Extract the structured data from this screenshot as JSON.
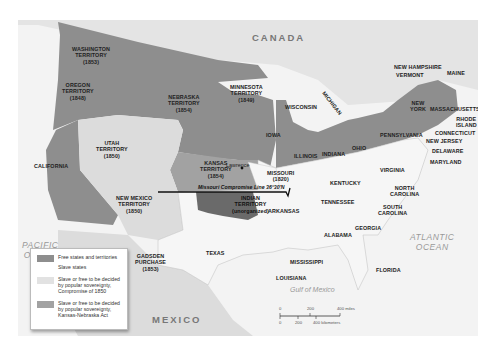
{
  "map": {
    "countries": {
      "canada": "CANADA",
      "mexico": "MEXICO"
    },
    "oceans": {
      "pacific": "PACIFIC\nOCEAN",
      "atlantic": "ATLANTIC\nOCEAN",
      "gulf": "Gulf of Mexico"
    },
    "territories": {
      "washington": "WASHINGTON\nTERRITORY\n(1853)",
      "oregon": "OREGON\nTERRITORY\n(1848)",
      "nebraska": "NEBRASKA\nTERRITORY\n(1854)",
      "minnesota": "MINNESOTA\nTERRITORY\n(1849)",
      "utah": "UTAH\nTERRITORY\n(1850)",
      "kansas": "KANSAS\nTERRITORY\n(1854)",
      "new_mexico": "NEW MEXICO\nTERRITORY\n(1850)",
      "indian": "INDIAN\nTERRITORY\n(unorganized)",
      "gadsden": "GADSDEN\nPURCHASE\n(1853)"
    },
    "states": {
      "california": "CALIFORNIA",
      "texas": "TEXAS",
      "missouri": "MISSOURI\n(1820)",
      "iowa": "IOWA",
      "wisconsin": "WISCONSIN",
      "michigan": "MICHIGAN",
      "illinois": "ILLINOIS",
      "indiana": "INDIANA",
      "ohio": "OHIO",
      "pennsylvania": "PENNSYLVANIA",
      "new_york": "NEW\nYORK",
      "new_hampshire": "NEW HAMPSHIRE",
      "vermont": "VERMONT",
      "maine": "MAINE",
      "massachusetts": "MASSACHUSETTS",
      "rhode_island": "RHODE\nISLAND",
      "connecticut": "CONNECTICUT",
      "new_jersey": "NEW JERSEY",
      "delaware": "DELAWARE",
      "maryland": "MARYLAND",
      "virginia": "VIRGINIA",
      "kentucky": "KENTUCKY",
      "tennessee": "TENNESSEE",
      "north_carolina": "NORTH\nCAROLINA",
      "south_carolina": "SOUTH\nCAROLINA",
      "georgia": "GEORGIA",
      "alabama": "ALABAMA",
      "mississippi": "MISSISSIPPI",
      "arkansas": "ARKANSAS",
      "louisiana": "LOUISIANA",
      "florida": "FLORIDA"
    },
    "towns": {
      "lawrence": "Lawrence"
    },
    "compromise_line": "Missouri Compromise Line 36°30'N"
  },
  "legend": {
    "items": [
      {
        "label": "Free states and territories",
        "color": "#8e8e8e"
      },
      {
        "label": "Slave states",
        "color": "#f2f2f2"
      },
      {
        "label": "Slave or free to be decided\nby popular sovereignty,\nCompromise of 1850",
        "color": "#dcdcdc"
      },
      {
        "label": "Slave or free to be decided\nby popular sovereignty,\nKansas-Nebraska Act",
        "color": "#a2a2a2"
      }
    ]
  },
  "scale": {
    "miles": [
      "0",
      "200",
      "400 miles"
    ],
    "kilometers": [
      "0",
      "200",
      "400 kilometers"
    ]
  },
  "colors": {
    "free": "#8e8e8e",
    "slave": "#f2f2f2",
    "compromise_1850": "#dcdcdc",
    "kansas_nebraska": "#a2a2a2",
    "indian_territory": "#6a6a6a",
    "water": "#f4f4f4",
    "foreign_land": "#e0e0e0"
  }
}
